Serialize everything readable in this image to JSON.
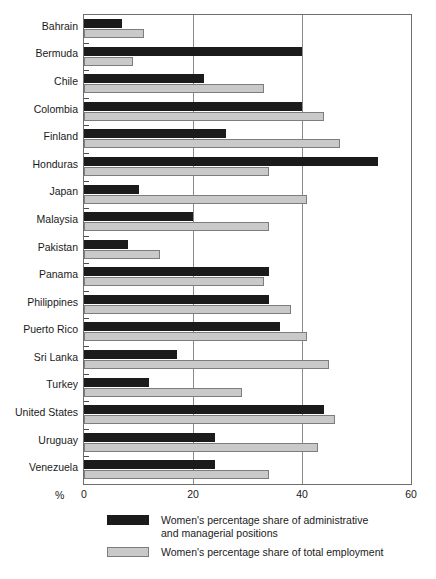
{
  "chart_data": {
    "type": "bar",
    "orientation": "horizontal",
    "title": "",
    "xlabel": "%",
    "ylabel": "",
    "xlim": [
      0,
      60
    ],
    "xticks": [
      "0",
      "20",
      "40",
      "60"
    ],
    "grid": true,
    "legend_position": "below",
    "categories": [
      "Bahrain",
      "Bermuda",
      "Chile",
      "Colombia",
      "Finland",
      "Honduras",
      "Japan",
      "Malaysia",
      "Pakistan",
      "Panama",
      "Philippines",
      "Puerto Rico",
      "Sri Lanka",
      "Turkey",
      "United States",
      "Uruguay",
      "Venezuela"
    ],
    "series": [
      {
        "name": "Women's percentage share of administrative\nand managerial positions",
        "color": "#1b1b1b",
        "values": [
          7,
          40,
          22,
          40,
          26,
          54,
          10,
          20,
          8,
          34,
          34,
          36,
          17,
          12,
          44,
          24,
          24
        ]
      },
      {
        "name": "Women's percentage share of total employment",
        "color": "#c9c9c9",
        "values": [
          11,
          9,
          33,
          44,
          47,
          34,
          41,
          34,
          14,
          33,
          38,
          41,
          45,
          29,
          46,
          43,
          34
        ]
      }
    ]
  },
  "axis": {
    "unit_label": "%",
    "ticks": [
      {
        "label": "0",
        "value": 0
      },
      {
        "label": "20",
        "value": 20
      },
      {
        "label": "40",
        "value": 40
      },
      {
        "label": "60",
        "value": 60
      }
    ]
  },
  "legend": {
    "items": [
      {
        "swatch": "dark",
        "label": "Women's percentage share of administrative\nand managerial positions"
      },
      {
        "swatch": "light",
        "label": "Women's percentage share of total employment"
      }
    ]
  }
}
